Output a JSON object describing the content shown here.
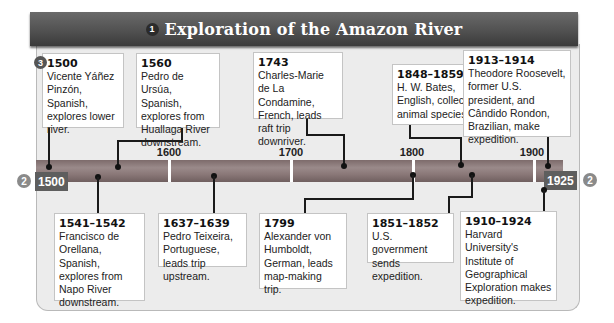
{
  "header": {
    "badge": "1",
    "title": "Exploration of the Amazon River"
  },
  "timeline": {
    "start_label": "1500",
    "end_label": "1925",
    "start_badge": "2",
    "end_badge": "2",
    "ticks": [
      "1600",
      "1700",
      "1800",
      "1900"
    ],
    "events_badge": "3"
  },
  "events_top": [
    {
      "year": "1500",
      "text": "Vicente Yáñez Pinzón, Spanish, explores lower river."
    },
    {
      "year": "1560",
      "text": "Pedro de Ursúa, Spanish, explores from Huallaga River downstream."
    },
    {
      "year": "1743",
      "text": "Charles-Marie de La Condamine, French, leads raft trip downriver."
    },
    {
      "year": "1848–1859",
      "text": "H. W. Bates, English, collects animal species."
    },
    {
      "year": "1913–1914",
      "text": "Theodore Roosevelt, former U.S. president, and Cândido Rondon, Brazilian, make expedition."
    }
  ],
  "events_bottom": [
    {
      "year": "1541–1542",
      "text": "Francisco de Orellana, Spanish, explores from Napo River downstream."
    },
    {
      "year": "1637–1639",
      "text": "Pedro Teixeira, Portuguese, leads trip upstream."
    },
    {
      "year": "1799",
      "text": "Alexander von Humboldt, German, leads map-making trip."
    },
    {
      "year": "1851–1852",
      "text": "U.S. government sends expedition."
    },
    {
      "year": "1910–1924",
      "text": "Harvard University's Institute of Geographical Exploration makes expedition."
    }
  ],
  "colors": {
    "header_bg": "#4f4f4f",
    "panel_bg": "#ececec",
    "bar": "#8a7878",
    "end_label_bg": "#5e5e5e"
  }
}
